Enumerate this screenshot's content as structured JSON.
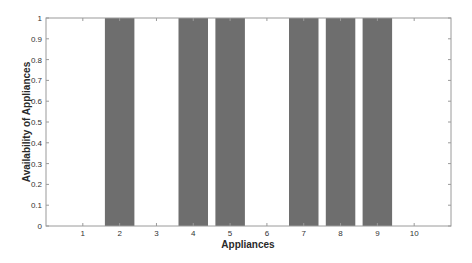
{
  "chart_data": {
    "type": "bar",
    "title": "",
    "xlabel": "Appliances",
    "ylabel": "Availability of Appliances",
    "categories": [
      "1",
      "2",
      "3",
      "4",
      "5",
      "6",
      "7",
      "8",
      "9",
      "10"
    ],
    "values": [
      0,
      1,
      0,
      1,
      1,
      0,
      1,
      1,
      1,
      0
    ],
    "ylim": [
      0,
      1
    ],
    "xlim": [
      0,
      11
    ],
    "yticks": [
      "0",
      "0.1",
      "0.2",
      "0.3",
      "0.4",
      "0.5",
      "0.6",
      "0.7",
      "0.8",
      "0.9",
      "1"
    ],
    "grid": false,
    "legend": null,
    "bar_color": "#6e6e6e"
  }
}
